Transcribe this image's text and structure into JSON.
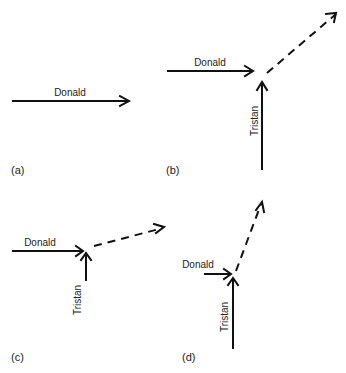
{
  "panels": [
    {
      "id": "a",
      "label": "(a)",
      "vectors": [
        {
          "name": "Donald",
          "style": "solid",
          "direction": "east"
        }
      ]
    },
    {
      "id": "b",
      "label": "(b)",
      "vectors": [
        {
          "name": "Donald",
          "style": "solid",
          "direction": "east"
        },
        {
          "name": "Tristan",
          "style": "solid",
          "direction": "north"
        },
        {
          "name": "resultant",
          "style": "dashed",
          "direction": "north-east"
        }
      ]
    },
    {
      "id": "c",
      "label": "(c)",
      "vectors": [
        {
          "name": "Donald",
          "style": "solid",
          "direction": "east"
        },
        {
          "name": "Tristan",
          "style": "solid",
          "direction": "north"
        },
        {
          "name": "resultant",
          "style": "dashed",
          "direction": "east-north-east"
        }
      ]
    },
    {
      "id": "d",
      "label": "(d)",
      "vectors": [
        {
          "name": "Donald",
          "style": "solid",
          "direction": "east"
        },
        {
          "name": "Tristan",
          "style": "solid",
          "direction": "north"
        },
        {
          "name": "resultant",
          "style": "dashed",
          "direction": "north-north-east"
        }
      ]
    }
  ],
  "labels": {
    "donald": "Donald",
    "tristan": "Tristan"
  }
}
